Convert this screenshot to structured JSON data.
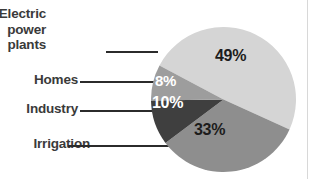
{
  "chart_data": {
    "type": "pie",
    "title": "",
    "categories": [
      "Electric power plants",
      "Irrigation",
      "Industry",
      "Homes"
    ],
    "values": [
      49,
      33,
      10,
      8
    ],
    "value_labels": [
      "49%",
      "33%",
      "10%",
      "8%"
    ],
    "unit": "%",
    "legend": "none",
    "grid": false,
    "slices": [
      {
        "label": "Electric power plants",
        "label_lines": "Electric\npower\nplants",
        "value": 49,
        "value_label": "49%",
        "color": "#d5d5d5",
        "value_text_color": "#1c1c1c"
      },
      {
        "label": "Irrigation",
        "label_lines": "Irrigation",
        "value": 33,
        "value_label": "33%",
        "color": "#8e8e8e",
        "value_text_color": "#1c1c1c"
      },
      {
        "label": "Industry",
        "label_lines": "Industry",
        "value": 10,
        "value_label": "10%",
        "color": "#3f3f3f",
        "value_text_color": "#ffffff"
      },
      {
        "label": "Homes",
        "label_lines": "Homes",
        "value": 8,
        "value_label": "8%",
        "color": "#9d9d9d",
        "value_text_color": "#ffffff"
      }
    ]
  },
  "labels": {
    "electric": "Electric\npower\nplants",
    "homes": "Homes",
    "industry": "Industry",
    "irrigation": "Irrigation"
  },
  "values": {
    "electric": "49%",
    "homes": "8%",
    "industry": "10%",
    "irrigation": "33%"
  },
  "colors": {
    "background": "#ffffff",
    "label_text": "#3a3a3a",
    "leader_line": "#2b2b2b",
    "slice_electric": "#d5d5d5",
    "slice_homes": "#9d9d9d",
    "slice_industry": "#3f3f3f",
    "slice_irrigation": "#8e8e8e"
  }
}
